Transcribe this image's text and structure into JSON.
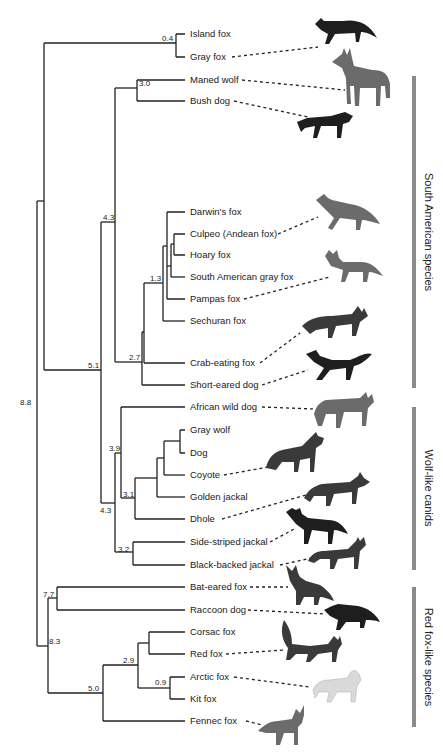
{
  "figure": {
    "type": "phylogenetic tree"
  },
  "leaves": [
    {
      "label": "Island fox",
      "y": 34,
      "illustrated": false
    },
    {
      "label": "Gray fox",
      "y": 57,
      "illustrated": true
    },
    {
      "label": "Maned wolf",
      "y": 80,
      "illustrated": true
    },
    {
      "label": "Bush dog",
      "y": 101,
      "illustrated": true
    },
    {
      "label": "Darwin's fox",
      "y": 212,
      "illustrated": false
    },
    {
      "label": "Culpeo (Andean fox)",
      "y": 234,
      "illustrated": true
    },
    {
      "label": "Hoary fox",
      "y": 255,
      "illustrated": false
    },
    {
      "label": "South American gray fox",
      "y": 277,
      "illustrated": false
    },
    {
      "label": "Pampas fox",
      "y": 299,
      "illustrated": true
    },
    {
      "label": "Sechuran fox",
      "y": 321,
      "illustrated": false
    },
    {
      "label": "Crab-eating fox",
      "y": 363,
      "illustrated": true
    },
    {
      "label": "Short-eared dog",
      "y": 385,
      "illustrated": true
    },
    {
      "label": "African wild dog",
      "y": 407,
      "illustrated": true
    },
    {
      "label": "Gray wolf",
      "y": 430,
      "illustrated": false
    },
    {
      "label": "Dog",
      "y": 453,
      "illustrated": false
    },
    {
      "label": "Coyote",
      "y": 475,
      "illustrated": true
    },
    {
      "label": "Golden jackal",
      "y": 497,
      "illustrated": false
    },
    {
      "label": "Dhole",
      "y": 519,
      "illustrated": true
    },
    {
      "label": "Side-striped jackal",
      "y": 542,
      "illustrated": true
    },
    {
      "label": "Black-backed jackal",
      "y": 565,
      "illustrated": true
    },
    {
      "label": "Bat-eared fox",
      "y": 587,
      "illustrated": true
    },
    {
      "label": "Raccoon dog",
      "y": 610,
      "illustrated": true
    },
    {
      "label": "Corsac fox",
      "y": 632,
      "illustrated": false
    },
    {
      "label": "Red fox",
      "y": 654,
      "illustrated": true
    },
    {
      "label": "Arctic fox",
      "y": 677,
      "illustrated": true
    },
    {
      "label": "Kit fox",
      "y": 699,
      "illustrated": false
    },
    {
      "label": "Fennec fox",
      "y": 721,
      "illustrated": true
    }
  ],
  "node_labels": [
    {
      "value": "0.4",
      "note": "Island fox + Gray fox"
    },
    {
      "value": "3.0",
      "note": "Maned wolf + Bush dog"
    },
    {
      "value": "4.3",
      "note": "South American clade"
    },
    {
      "value": "1.3",
      "note": "Darwin's fox ... Sechuran fox"
    },
    {
      "value": "2.7",
      "note": "Lycalopex + Crab-eating fox + Short-eared dog"
    },
    {
      "value": "5.1",
      "note": "South American + Wolf-like"
    },
    {
      "value": "8.8",
      "note": "Root"
    },
    {
      "value": "3.9",
      "note": "African wild dog + wolf-like core"
    },
    {
      "value": "3.1",
      "note": "Gray wolf ... Dhole"
    },
    {
      "value": "4.3",
      "note": "Wolf-like canids"
    },
    {
      "value": "3.2",
      "note": "Side-striped + Black-backed jackal"
    },
    {
      "value": "7.7",
      "note": "Bat-eared fox + Raccoon dog"
    },
    {
      "value": "8.3",
      "note": "Red fox-like clade + Bat-eared/Raccoon dog"
    },
    {
      "value": "2.9",
      "note": "Corsac, Red, Arctic, Kit fox"
    },
    {
      "value": "0.9",
      "note": "Arctic fox + Kit fox"
    },
    {
      "value": "5.0",
      "note": "Vulpes clade"
    }
  ],
  "groups": [
    {
      "label": "South American species",
      "y_top": 76,
      "y_bottom": 388,
      "color": "#8a8a8a"
    },
    {
      "label": "Wolf-like canids",
      "y_top": 407,
      "y_bottom": 570,
      "color": "#8a8a8a"
    },
    {
      "label": "Red fox-like species",
      "y_top": 587,
      "y_bottom": 727,
      "color": "#8a8a8a"
    }
  ],
  "colors": {
    "line": "#222222",
    "bar": "#8a8a8a",
    "background": "#ffffff"
  }
}
